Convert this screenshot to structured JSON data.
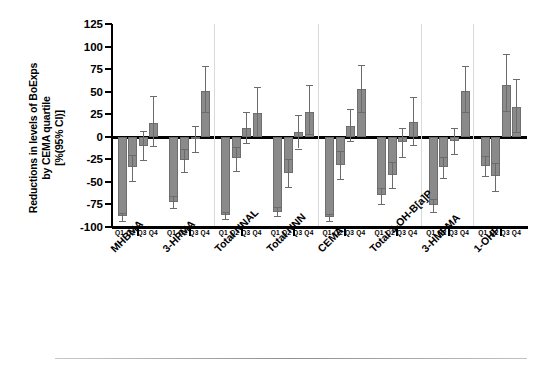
{
  "chart_data": {
    "type": "bar",
    "title": "",
    "ylabel_line1": "Reductions in levels of BoExps",
    "ylabel_line2": "by CEMA quartile",
    "ylabel_line3": "[%(95% CI)]",
    "xlabel": "",
    "ylim": [
      -100,
      125
    ],
    "yticks": [
      125,
      100,
      75,
      50,
      25,
      0,
      -25,
      -50,
      -75,
      -100
    ],
    "ytick_labels": [
      "125",
      "100",
      "75",
      "50",
      "25",
      "0",
      "-25",
      "-50",
      "-75",
      "-100"
    ],
    "grid": false,
    "legend": "none",
    "quartile_labels": [
      "Q1",
      "Q2",
      "Q3",
      "Q4"
    ],
    "categories": [
      "MHBMA",
      "3-HPMA",
      "Total NNAL",
      "Total NNN",
      "CEMA",
      "Total 3-OH-B[a]P",
      "3-HMPMA",
      "1-OHP"
    ],
    "series": [
      {
        "name": "Q1",
        "values": [
          -88,
          -72,
          -87,
          -83,
          -89,
          -65,
          -76,
          -32
        ]
      },
      {
        "name": "Q2",
        "values": [
          -34,
          -26,
          -24,
          -40,
          -31,
          -42,
          -34,
          -44
        ]
      },
      {
        "name": "Q3",
        "values": [
          -10,
          -3,
          10,
          5,
          12,
          -6,
          -5,
          57
        ]
      },
      {
        "name": "Q4",
        "values": [
          15,
          51,
          26,
          28,
          53,
          16,
          51,
          33
        ]
      }
    ],
    "error_low": [
      [
        -93,
        -79,
        -91,
        -88,
        -93,
        -74,
        -83,
        -44
      ],
      [
        -49,
        -39,
        -38,
        -56,
        -47,
        -57,
        -46,
        -60
      ],
      [
        -26,
        -17,
        -7,
        -13,
        -5,
        -22,
        -19,
        29
      ],
      [
        -10,
        27,
        1,
        3,
        27,
        -9,
        27,
        5
      ]
    ],
    "error_high": [
      [
        -84,
        -66,
        -83,
        -78,
        -86,
        -57,
        -69,
        -21
      ],
      [
        -20,
        -13,
        -11,
        -25,
        -16,
        -28,
        -22,
        -29
      ],
      [
        6,
        12,
        27,
        24,
        31,
        10,
        10,
        92
      ],
      [
        45,
        78,
        55,
        57,
        80,
        44,
        78,
        64
      ]
    ],
    "bar_color": "#8a8a8a",
    "error_color": "#6b6b6b",
    "axis_color": "#000000",
    "separator_color": "#d9d9d9"
  },
  "axis": {
    "y_title_l1": "Reductions in levels of BoExps",
    "y_title_l2": "by CEMA quartile",
    "y_title_l3": "[%(95% CI)]"
  }
}
